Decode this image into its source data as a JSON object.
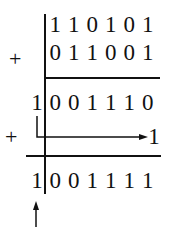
{
  "diagram": {
    "title": "",
    "operand_a": [
      "1",
      "1",
      "0",
      "1",
      "0",
      "1"
    ],
    "operand_b": [
      "0",
      "1",
      "1",
      "0",
      "0",
      "1"
    ],
    "partial_sum_carry": "1",
    "partial_sum": [
      "0",
      "0",
      "1",
      "1",
      "1",
      "0"
    ],
    "end_around_carry": "1",
    "result_carry": "1",
    "result": [
      "0",
      "0",
      "1",
      "1",
      "1",
      "1"
    ],
    "plus_sign": "+",
    "colors": {
      "ink": "#111111",
      "background": "#ffffff"
    }
  }
}
